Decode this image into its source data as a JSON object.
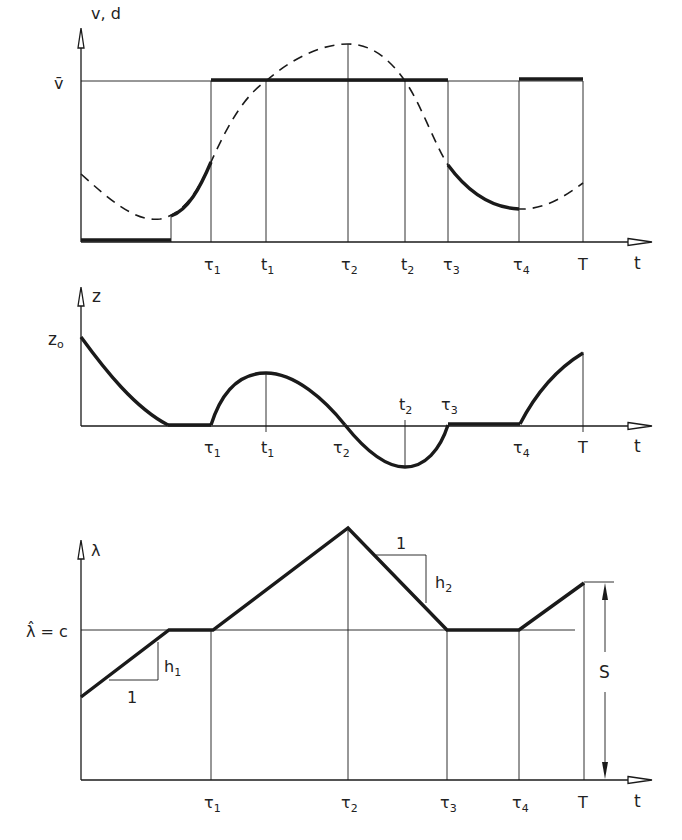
{
  "colors": {
    "ink": "#1a1a1a",
    "background": "#ffffff"
  },
  "panels": [
    {
      "id": "velocity",
      "y_axis_label": "v, d",
      "x_axis_label": "t",
      "level_label": "v̄",
      "ticks": [
        {
          "base": "τ",
          "sub": "1"
        },
        {
          "base": "t",
          "sub": "1"
        },
        {
          "base": "τ",
          "sub": "2"
        },
        {
          "base": "t",
          "sub": "2"
        },
        {
          "base": "τ",
          "sub": "3"
        },
        {
          "base": "τ",
          "sub": "4"
        },
        {
          "base": "T",
          "sub": ""
        }
      ]
    },
    {
      "id": "storage",
      "y_axis_label": "z",
      "x_axis_label": "t",
      "level_label": "z",
      "level_label_sub": "o",
      "ticks_below": [
        {
          "base": "τ",
          "sub": "1"
        },
        {
          "base": "t",
          "sub": "1"
        },
        {
          "base": "τ",
          "sub": "2"
        },
        {
          "base": "τ",
          "sub": "4"
        },
        {
          "base": "T",
          "sub": ""
        }
      ],
      "ticks_above": [
        {
          "base": "t",
          "sub": "2"
        },
        {
          "base": "τ",
          "sub": "3"
        }
      ]
    },
    {
      "id": "shadow-price",
      "y_axis_label": "λ",
      "x_axis_label": "t",
      "level_label": "λ̂ = c",
      "slope1_run": "1",
      "slope1_rise": "h",
      "slope1_rise_sub": "1",
      "slope2_run": "1",
      "slope2_rise": "h",
      "slope2_rise_sub": "2",
      "dimension_label": "S",
      "ticks": [
        {
          "base": "τ",
          "sub": "1"
        },
        {
          "base": "τ",
          "sub": "2"
        },
        {
          "base": "τ",
          "sub": "3"
        },
        {
          "base": "τ",
          "sub": "4"
        },
        {
          "base": "T",
          "sub": ""
        }
      ]
    }
  ]
}
